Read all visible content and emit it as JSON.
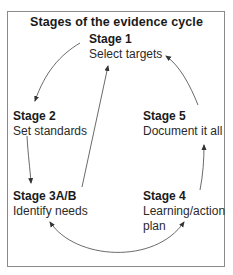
{
  "diagram": {
    "title": "Stages of the evidence cycle",
    "stages": [
      {
        "id": "stage-1",
        "name": "Stage 1",
        "description": "Select targets"
      },
      {
        "id": "stage-2",
        "name": "Stage 2",
        "description": "Set standards"
      },
      {
        "id": "stage-3ab",
        "name": "Stage 3A/B",
        "description": "Identify needs"
      },
      {
        "id": "stage-4",
        "name": "Stage 4",
        "description_line1": "Learning/action",
        "description_line2": "plan"
      },
      {
        "id": "stage-5",
        "name": "Stage 5",
        "description": "Document it all"
      }
    ],
    "arrows": [
      {
        "from": "Stage 1",
        "to": "Stage 2"
      },
      {
        "from": "Stage 2",
        "to": "Stage 3A/B"
      },
      {
        "from": "Stage 3A/B",
        "to": "Stage 1"
      },
      {
        "from": "Stage 3A/B",
        "to": "Stage 4"
      },
      {
        "from": "Stage 4",
        "to": "Stage 3A/B"
      },
      {
        "from": "Stage 4",
        "to": "Stage 5"
      },
      {
        "from": "Stage 5",
        "to": "Stage 1"
      }
    ],
    "colors": {
      "border": "#8a8a8a",
      "arrow": "#333333",
      "text": "#1a1a1a"
    }
  }
}
